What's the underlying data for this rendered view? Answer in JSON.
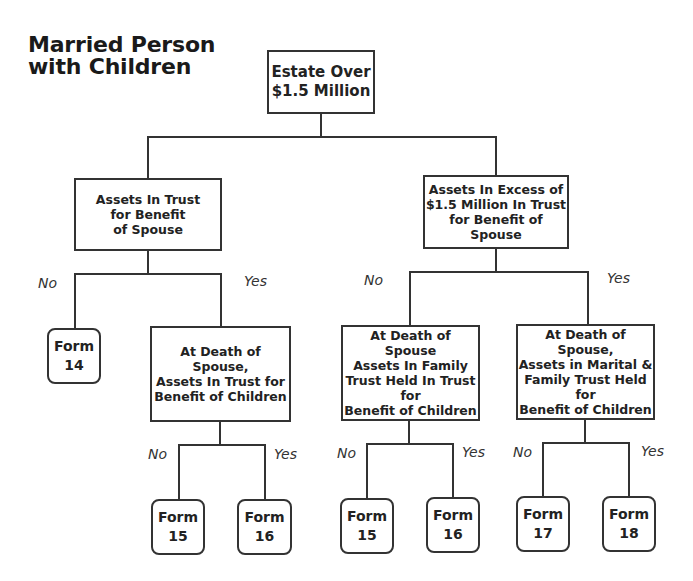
{
  "title": {
    "line1": "Married Person",
    "line2": "with Children"
  },
  "nodes": {
    "root": "Estate Over\n$1.5 Million",
    "left_decision": "Assets In Trust\nfor Benefit\nof Spouse",
    "right_decision": "Assets In Excess of\n$1.5 Million In Trust\nfor Benefit of Spouse",
    "left_yes_decision": "At Death of Spouse,\nAssets In Trust for\nBenefit of Children",
    "right_no_decision": "At Death of Spouse\nAssets In Family\nTrust Held In Trust for\nBenefit of Children",
    "right_yes_decision": "At Death of Spouse,\nAssets in Marital &\nFamily Trust Held for\nBenefit of Children"
  },
  "forms": [
    {
      "label": "Form",
      "number": "14"
    },
    {
      "label": "Form",
      "number": "15"
    },
    {
      "label": "Form",
      "number": "16"
    },
    {
      "label": "Form",
      "number": "15"
    },
    {
      "label": "Form",
      "number": "16"
    },
    {
      "label": "Form",
      "number": "17"
    },
    {
      "label": "Form",
      "number": "18"
    }
  ],
  "branch_labels": {
    "no": "No",
    "yes": "Yes"
  }
}
